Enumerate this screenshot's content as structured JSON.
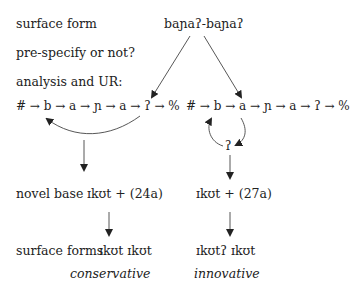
{
  "labels": {
    "surface_form": "surface form",
    "prespecify": "pre-specify or not?",
    "analysis": "analysis and UR:",
    "novel_base": "novel base",
    "surface_forms": "surface forms"
  },
  "top_form": "baɲaʔ-baɲaʔ",
  "left_chain": "# → b → a → ɲ → a → ʔ → %",
  "right_chain": "# → b → a → ɲ → a → ʔ → %",
  "right_loop_node": "ʔ",
  "left_branch": {
    "base": "ɪkʊt + (24a)",
    "surface": "ɪkʊt ɪkʊt",
    "label": "conservative"
  },
  "right_branch": {
    "base": "ɪkʊt + (27a)",
    "surface": "ɪkʊtʔ ɪkʊt",
    "label": "innovative"
  }
}
